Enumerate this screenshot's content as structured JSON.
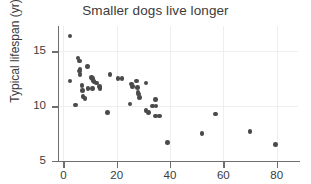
{
  "chart_data": {
    "type": "scatter",
    "title": "Smaller dogs live longer",
    "xlabel": "",
    "ylabel": "Typical lifespan (yr)",
    "xlim": [
      -2,
      88
    ],
    "ylim": [
      5,
      17.3
    ],
    "xticks": [
      0,
      20,
      40,
      60,
      80
    ],
    "yticks": [
      5,
      10,
      15
    ],
    "grid": true,
    "legend": null,
    "marker_color": "#4a4a4a",
    "points": [
      {
        "x": 2.5,
        "y": 16.4
      },
      {
        "x": 2.5,
        "y": 12.3
      },
      {
        "x": 4.5,
        "y": 10.1
      },
      {
        "x": 5.5,
        "y": 14.4
      },
      {
        "x": 6.0,
        "y": 14.1
      },
      {
        "x": 6.2,
        "y": 13.4
      },
      {
        "x": 6.0,
        "y": 13.2
      },
      {
        "x": 6.3,
        "y": 12.9
      },
      {
        "x": 7.0,
        "y": 11.9
      },
      {
        "x": 7.2,
        "y": 11.4
      },
      {
        "x": 7.4,
        "y": 10.9
      },
      {
        "x": 8.2,
        "y": 10.7
      },
      {
        "x": 9.0,
        "y": 13.6
      },
      {
        "x": 9.2,
        "y": 11.6
      },
      {
        "x": 10.5,
        "y": 12.6
      },
      {
        "x": 11.0,
        "y": 12.5
      },
      {
        "x": 11.3,
        "y": 12.3
      },
      {
        "x": 11.5,
        "y": 12.2
      },
      {
        "x": 11.0,
        "y": 11.6
      },
      {
        "x": 12.5,
        "y": 12.1
      },
      {
        "x": 13.5,
        "y": 11.8
      },
      {
        "x": 13.8,
        "y": 11.6
      },
      {
        "x": 16.5,
        "y": 9.4
      },
      {
        "x": 17.5,
        "y": 12.9
      },
      {
        "x": 20.5,
        "y": 12.5
      },
      {
        "x": 22.0,
        "y": 12.5
      },
      {
        "x": 25.5,
        "y": 12.0
      },
      {
        "x": 26.0,
        "y": 11.8
      },
      {
        "x": 25.0,
        "y": 10.2
      },
      {
        "x": 27.5,
        "y": 12.3
      },
      {
        "x": 27.8,
        "y": 11.7
      },
      {
        "x": 28.0,
        "y": 11.3
      },
      {
        "x": 28.2,
        "y": 11.1
      },
      {
        "x": 28.5,
        "y": 10.8
      },
      {
        "x": 31.0,
        "y": 12.1
      },
      {
        "x": 31.0,
        "y": 9.6
      },
      {
        "x": 32.0,
        "y": 9.4
      },
      {
        "x": 33.5,
        "y": 10.0
      },
      {
        "x": 34.5,
        "y": 10.6
      },
      {
        "x": 34.8,
        "y": 10.0
      },
      {
        "x": 34.5,
        "y": 9.1
      },
      {
        "x": 36.0,
        "y": 9.1
      },
      {
        "x": 39.0,
        "y": 6.7
      },
      {
        "x": 52.0,
        "y": 7.5
      },
      {
        "x": 57.0,
        "y": 9.3
      },
      {
        "x": 70.0,
        "y": 7.7
      },
      {
        "x": 79.5,
        "y": 6.5
      }
    ]
  }
}
